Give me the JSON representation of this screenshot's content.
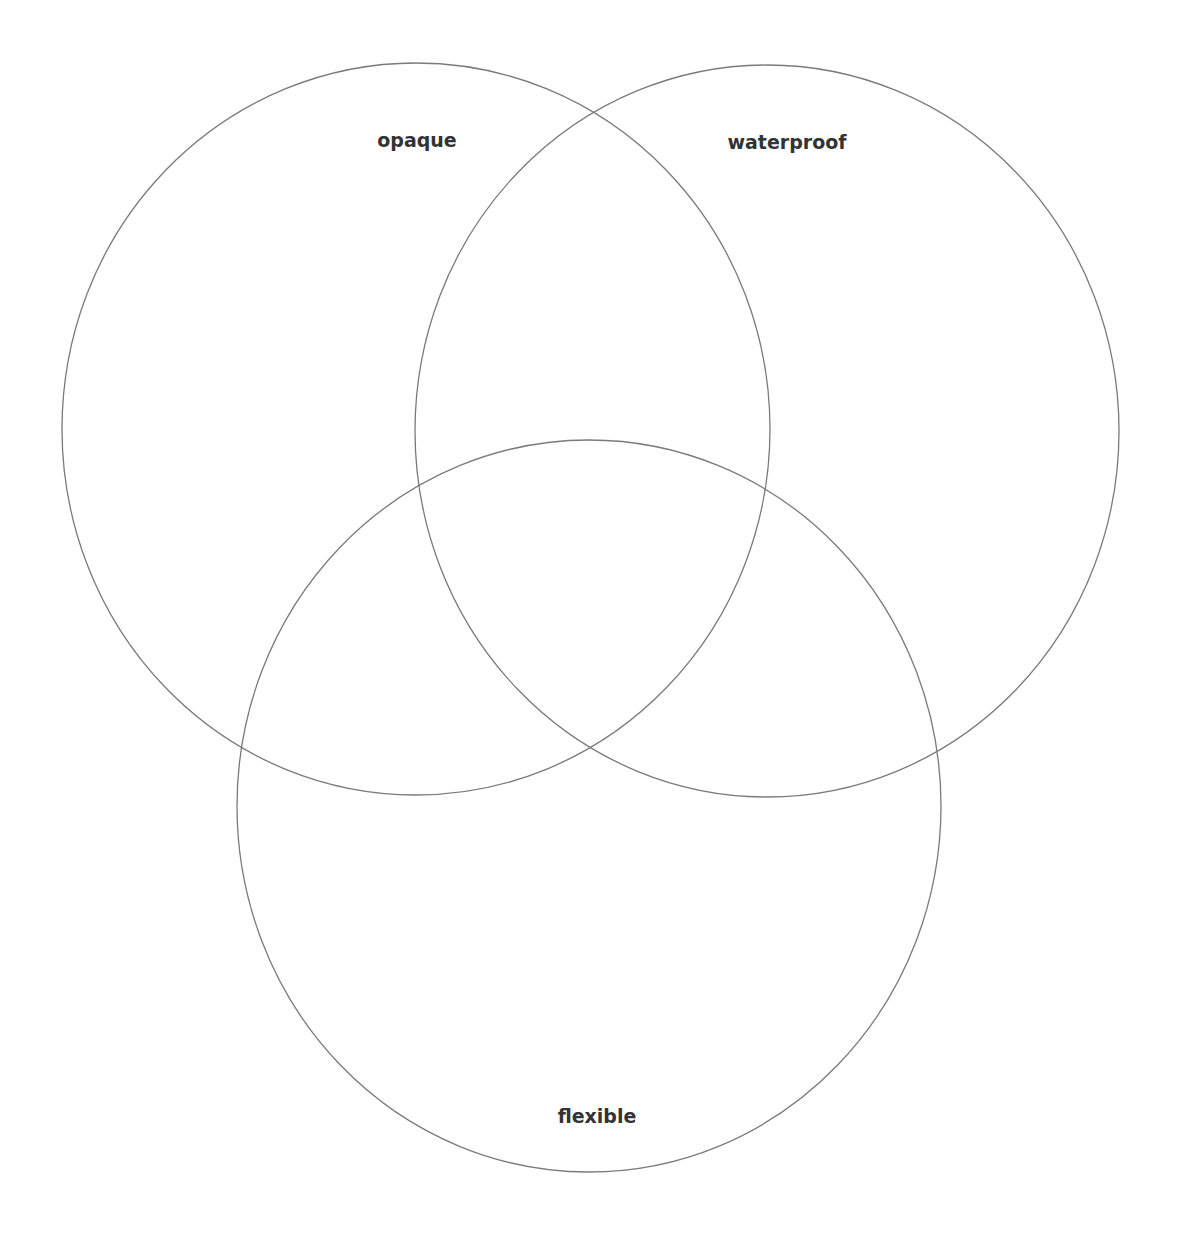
{
  "diagram": {
    "type": "venn",
    "sets": [
      {
        "id": "opaque",
        "label": "opaque",
        "cx": 416,
        "cy": 429,
        "rx": 354,
        "ry": 366,
        "label_x": 417,
        "label_y": 140
      },
      {
        "id": "waterproof",
        "label": "waterproof",
        "cx": 767,
        "cy": 431,
        "rx": 352,
        "ry": 366,
        "label_x": 787,
        "label_y": 142
      },
      {
        "id": "flexible",
        "label": "flexible",
        "cx": 589,
        "cy": 806,
        "rx": 352,
        "ry": 366,
        "label_x": 597,
        "label_y": 1116
      }
    ],
    "stroke_color": "#7a7a7a",
    "background": "#ffffff"
  }
}
